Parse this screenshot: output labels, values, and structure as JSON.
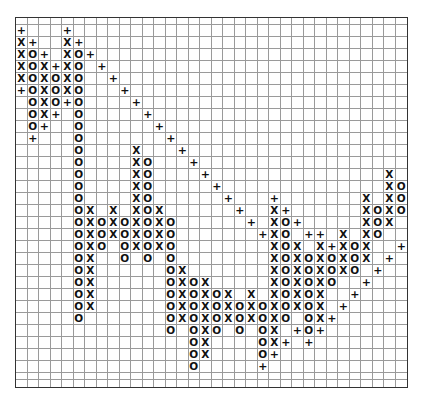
{
  "chart_data": {
    "type": "point-and-figure",
    "title": "",
    "xlabel": "",
    "ylabel": "",
    "columns": 34,
    "rows": 32,
    "grid": true,
    "symbols": {
      "X": "rising box",
      "O": "falling box",
      "+": "trend line marker"
    },
    "grid_rows": [
      "                                  ",
      "+   +                             ",
      "X+  X+                            ",
      "XO+ XO+                           ",
      "XOX+XO +                          ",
      "XOXOXO  +                         ",
      "+OXOXO   +                        ",
      " OXO+O    +                       ",
      " OX+ O     +                      ",
      " O+  O      +                     ",
      " +   O       +                    ",
      "     O    X   +                   ",
      "     O    XO   +                  ",
      "     O    XO    +               X ",
      "     O    XO     +              XO",
      "     O    XO      +   +       X XO",
      "     OX X XOX      +  X+      XOXO",
      "     OXOXOXOXO      + XO+     XOX ",
      "     OXOXOXOXO       +XO ++ X XO  ",
      "     OXO OXOXO        XOX X+XOX  +",
      "     OX  O O O        XOXOXOXOX + ",
      "     OX      OX       XOXOXOXO +  ",
      "     OX      OXOX     XOXOXO  +   ",
      "     OX      OXOXOX X XOXOX  +    ",
      "     OX      OXOXOXOXOXOXOX +     ",
      "     O       OXOXOXOXOXO OX+      ",
      "             O OXO O OX +O+       ",
      "               OX    OX+ +        ",
      "               OX    O+           ",
      "               O     +            ",
      "                                  ",
      "                                  "
    ]
  }
}
